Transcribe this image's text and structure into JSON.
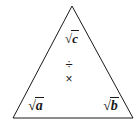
{
  "diagram": {
    "shape": "triangle",
    "background_color": "#ffffff",
    "stroke_color": "#1a1a1a",
    "text_color": "#1a1a1a",
    "stroke_width": 1,
    "vertices": {
      "apex": [
        72,
        6
      ],
      "bottom_left": [
        13,
        118
      ],
      "bottom_right": [
        133,
        118
      ]
    }
  },
  "labels": {
    "top": {
      "text": "√c",
      "sqrt_sign": "√",
      "radicand": "c",
      "position": "apex"
    },
    "bottom_left": {
      "text": "√a",
      "sqrt_sign": "√",
      "radicand": "a",
      "position": "bottom-left"
    },
    "bottom_right": {
      "text": "√b",
      "sqrt_sign": "√",
      "radicand": "b",
      "position": "bottom-right"
    }
  },
  "operators": {
    "divide": {
      "symbol": "÷",
      "name": "division-sign"
    },
    "multiply": {
      "symbol": "×",
      "name": "multiplication-sign"
    }
  }
}
